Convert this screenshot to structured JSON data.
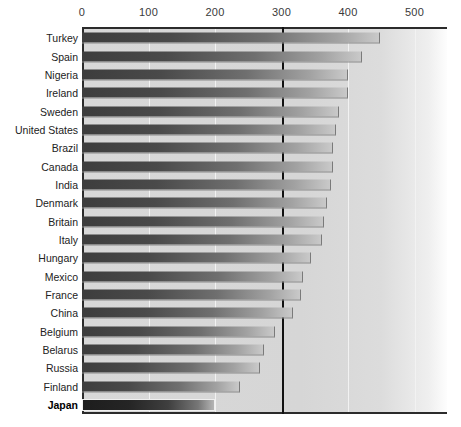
{
  "chart_data": {
    "type": "bar",
    "orientation": "horizontal",
    "title": "",
    "subtitle": "",
    "xlabel": "",
    "ylabel": "",
    "xlim": [
      0,
      550
    ],
    "ylim": null,
    "grid": true,
    "legend": null,
    "legend_position": "none",
    "x_ticks": [
      0,
      100,
      200,
      300,
      400,
      500
    ],
    "x_tick_labels": [
      "0",
      "100",
      "200",
      "300",
      "400",
      "500"
    ],
    "annotations": [
      {
        "name": "threshold-line",
        "type": "vertical-line",
        "value": 300,
        "color": "#111111"
      }
    ],
    "highlight_category": "Japan",
    "categories": [
      "Turkey",
      "Spain",
      "Nigeria",
      "Ireland",
      "Sweden",
      "United States",
      "Brazil",
      "Canada",
      "India",
      "Denmark",
      "Britain",
      "Italy",
      "Hungary",
      "Mexico",
      "France",
      "China",
      "Belgium",
      "Belarus",
      "Russia",
      "Finland",
      "Japan"
    ],
    "values": [
      448,
      421,
      400,
      400,
      386,
      382,
      378,
      377,
      375,
      368,
      364,
      361,
      344,
      332,
      329,
      317,
      290,
      273,
      268,
      238,
      200
    ],
    "colors": {
      "bar_dark": "#3d3d3d",
      "bar_light": "#c9c9c9",
      "highlight_bar_dark": "#1d1d1d",
      "plot_background": "#d8d8d8",
      "axis": "#2b2b2b",
      "gridline": "#f2f2f2",
      "threshold": "#111111",
      "label_text": "#222222",
      "tick_text": "#3a3a3a"
    }
  }
}
